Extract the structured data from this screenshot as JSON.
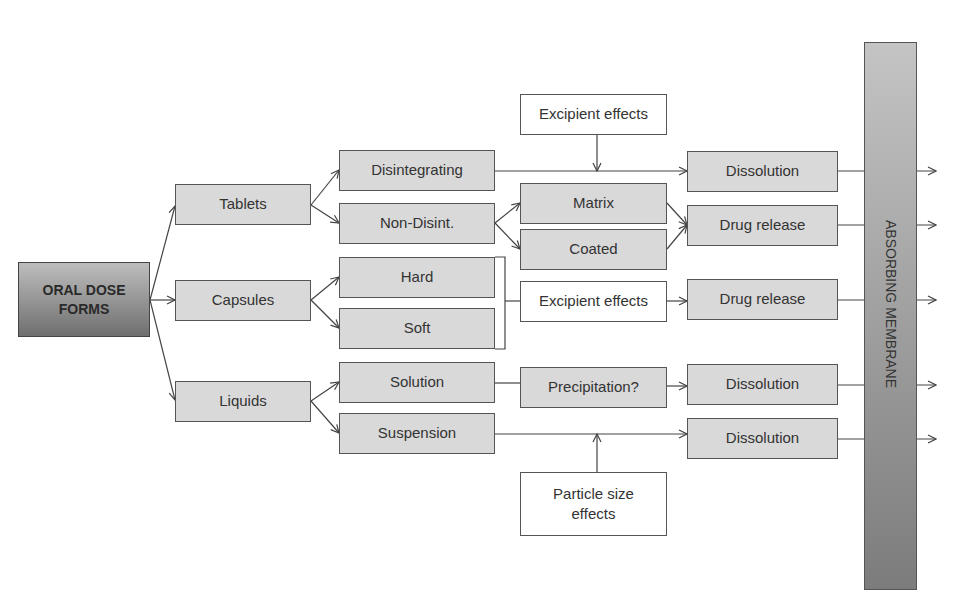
{
  "diagram": {
    "type": "flowchart",
    "root": "ORAL DOSE FORMS",
    "membrane_label": "ABSORBING MEMBRANE",
    "colors": {
      "node_fill": "#d9d9d9",
      "node_border": "#555555",
      "root_gradient_top": "#bdbdbd",
      "root_gradient_bottom": "#6f6f6f",
      "membrane_top": "#c4c4c4",
      "membrane_bottom": "#7c7c7c"
    },
    "level1": {
      "tablets": "Tablets",
      "capsules": "Capsules",
      "liquids": "Liquids"
    },
    "level2": {
      "disintegrating": "Disintegrating",
      "non_disint": "Non-Disint.",
      "hard": "Hard",
      "soft": "Soft",
      "solution": "Solution",
      "suspension": "Suspension"
    },
    "level3": {
      "excipient_effects_top": "Excipient effects",
      "matrix": "Matrix",
      "coated": "Coated",
      "excipient_effects_mid": "Excipient effects",
      "precipitation": "Precipitation?",
      "particle_size_effects": "Particle size effects"
    },
    "outcomes": {
      "dissolution_1": "Dissolution",
      "drug_release_1": "Drug release",
      "drug_release_2": "Drug release",
      "dissolution_2": "Dissolution",
      "dissolution_3": "Dissolution"
    },
    "edges": [
      [
        "ORAL DOSE FORMS",
        "Tablets"
      ],
      [
        "ORAL DOSE FORMS",
        "Capsules"
      ],
      [
        "ORAL DOSE FORMS",
        "Liquids"
      ],
      [
        "Tablets",
        "Disintegrating"
      ],
      [
        "Tablets",
        "Non-Disint."
      ],
      [
        "Capsules",
        "Hard"
      ],
      [
        "Capsules",
        "Soft"
      ],
      [
        "Liquids",
        "Solution"
      ],
      [
        "Liquids",
        "Suspension"
      ],
      [
        "Disintegrating",
        "Dissolution"
      ],
      [
        "Excipient effects",
        "Disintegrating→Dissolution"
      ],
      [
        "Non-Disint.",
        "Matrix"
      ],
      [
        "Non-Disint.",
        "Coated"
      ],
      [
        "Matrix",
        "Drug release"
      ],
      [
        "Coated",
        "Drug release"
      ],
      [
        "Hard/Soft",
        "Excipient effects"
      ],
      [
        "Excipient effects",
        "Drug release"
      ],
      [
        "Solution",
        "Precipitation?"
      ],
      [
        "Precipitation?",
        "Dissolution"
      ],
      [
        "Suspension",
        "Dissolution"
      ],
      [
        "Particle size effects",
        "Suspension→Dissolution"
      ],
      [
        "Outcomes",
        "ABSORBING MEMBRANE"
      ]
    ]
  }
}
